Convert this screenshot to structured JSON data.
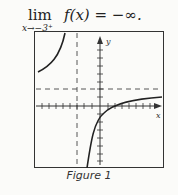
{
  "equation": {
    "lim_word": "lim",
    "subscript": "x→−3⁺",
    "expression": "f(x) = −∞."
  },
  "figure": {
    "caption": "Figure 1",
    "x_axis_label": "x",
    "y_axis_label": "y",
    "vertical_asymptote": "x = -3",
    "horizontal_asymptote": "y = 2"
  }
}
